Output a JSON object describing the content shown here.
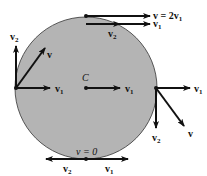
{
  "diagram": {
    "type": "rolling-wheel-velocity-vectors",
    "wheel": {
      "fill": "#b4b4b4",
      "stroke": "#333333",
      "center_label": "C"
    },
    "labels": {
      "top_v": "v = 2v",
      "top_v_sub": "1",
      "top_v1": "v",
      "top_v1_sub": "1",
      "top_v2": "v",
      "top_v2_sub": "2",
      "left_v2": "v",
      "left_v2_sub": "2",
      "left_v": "v",
      "left_v1": "v",
      "left_v1_sub": "1",
      "center_v1": "v",
      "center_v1_sub": "1",
      "right_v1": "v",
      "right_v1_sub": "1",
      "right_v2": "v",
      "right_v2_sub": "2",
      "right_v": "v",
      "bottom_v": "v = 0",
      "bottom_v2": "v",
      "bottom_v2_sub": "2",
      "bottom_v1": "v",
      "bottom_v1_sub": "1"
    }
  }
}
